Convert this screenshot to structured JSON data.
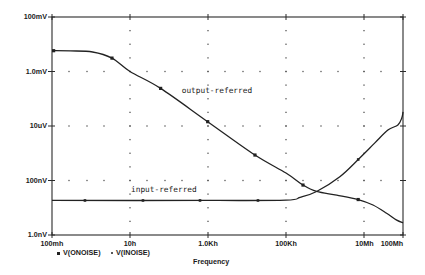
{
  "chart_data": {
    "type": "line",
    "title": "",
    "xlabel": "Frequency",
    "ylabel": "",
    "x_scale": "log",
    "y_scale": "log",
    "xlim": [
      0.1,
      100000000
    ],
    "ylim": [
      1e-09,
      0.1
    ],
    "grid": "dotted",
    "colors": {
      "line": "#222222",
      "grid": "#555555",
      "axis": "#2a2a2a",
      "background": "#ffffff"
    },
    "x_ticks": [
      {
        "value": 0.1,
        "label": "100mh"
      },
      {
        "value": 10,
        "label": "10h"
      },
      {
        "value": 1000,
        "label": "1.0Kh"
      },
      {
        "value": 100000,
        "label": "100Kh"
      },
      {
        "value": 10000000,
        "label": "10Mh"
      },
      {
        "value": 100000000,
        "label": "100Mh"
      }
    ],
    "y_ticks": [
      {
        "value": 0.1,
        "label": "100mV"
      },
      {
        "value": 0.001,
        "label": "1.0mV"
      },
      {
        "value": 1e-05,
        "label": "10uV"
      },
      {
        "value": 1e-07,
        "label": "100nV"
      },
      {
        "value": 1e-09,
        "label": "1.0nV"
      }
    ],
    "legend": {
      "position": "bottom-left",
      "entries": [
        {
          "marker": "square",
          "symbol": "■",
          "label": "V(ONOISE)"
        },
        {
          "marker": "dot",
          "symbol": "•",
          "label": "V(INOISE)"
        }
      ]
    },
    "series": [
      {
        "name": "V(ONOISE)",
        "marker": "square",
        "x": [
          0.1,
          0.3,
          1.1,
          3.45,
          10,
          61,
          982,
          16000,
          100000,
          273000,
          610000,
          2000000,
          7100000,
          17000000,
          38000000,
          69000000,
          100000000
        ],
        "y": [
          0.0058,
          0.0057,
          0.0052,
          0.0031,
          0.001,
          0.00024,
          1.44e-05,
          8.6e-07,
          1.88e-07,
          6.8e-08,
          3.95e-08,
          2.9e-08,
          2e-08,
          1.26e-08,
          6.3e-09,
          3.5e-09,
          2.8e-09
        ],
        "markers": {
          "x": [
            0.11,
            3.45,
            61,
            982,
            16000,
            273000,
            7100000
          ],
          "y": [
            0.0058,
            0.0031,
            0.00024,
            1.44e-05,
            8.6e-07,
            6.8e-08,
            2e-08
          ]
        }
      },
      {
        "name": "V(INOISE)",
        "marker": "dot",
        "x": [
          0.1,
          1000,
          100000,
          229000,
          610000,
          2400000,
          7100000,
          19000000,
          41000000,
          74000000,
          93000000,
          100000000
        ],
        "y": [
          1.85e-08,
          1.85e-08,
          1.9e-08,
          2.4e-08,
          3.95e-08,
          1.38e-07,
          5.9e-07,
          2.4e-06,
          7.1e-06,
          1.09e-05,
          1.97e-05,
          3.27e-05
        ],
        "markers": {
          "x": [
            0.7,
            21.5,
            624,
            19100,
            7100000
          ],
          "y": [
            1.85e-08,
            1.85e-08,
            1.85e-08,
            1.85e-08,
            5.9e-07
          ]
        }
      }
    ],
    "annotations": [
      {
        "text": "output-referred",
        "series": "V(ONOISE)",
        "x": 212,
        "y": 0.00021
      },
      {
        "text": "input-referred",
        "series": "V(INOISE)",
        "x": 10.6,
        "y": 4.5e-08
      }
    ]
  }
}
